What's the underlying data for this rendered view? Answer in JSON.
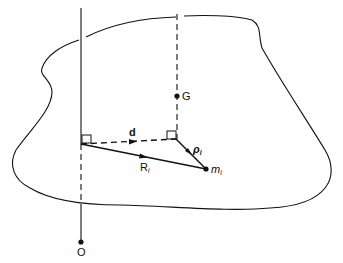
{
  "diagram": {
    "type": "rigid-body-geometry",
    "labels": {
      "origin": "O",
      "center_of_mass": "G",
      "distance_vector": "d",
      "position_vector_base": "R",
      "position_vector_sub": "i",
      "relative_vector_base": "ρ",
      "relative_vector_sub": "i",
      "mass_base": "m",
      "mass_sub": "i"
    },
    "elements": [
      {
        "name": "body-outline",
        "kind": "closed curve"
      },
      {
        "name": "axis-through-O",
        "kind": "vertical line (solid above/inside top, dashed inside body)"
      },
      {
        "name": "axis-through-G",
        "kind": "vertical dashed line"
      },
      {
        "name": "vector-d",
        "kind": "dashed arrow between perpendicular feet"
      },
      {
        "name": "vector-R_i",
        "kind": "solid arrow from axis foot to m_i"
      },
      {
        "name": "vector-rho_i",
        "kind": "solid arrow from G-axis foot to m_i"
      },
      {
        "name": "right-angle-markers",
        "count": 2
      }
    ],
    "colors": {
      "line": "#111111",
      "background": "#ffffff"
    }
  }
}
